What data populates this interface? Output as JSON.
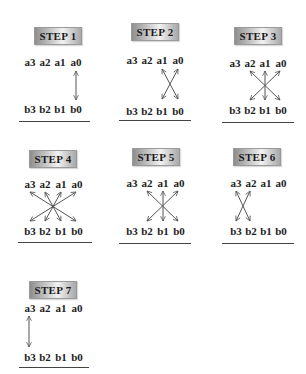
{
  "diagram": {
    "a_labels": [
      "a3",
      "a2",
      "a1",
      "a0"
    ],
    "b_labels": [
      "b3",
      "b2",
      "b1",
      "b0"
    ],
    "steps": [
      {
        "label": "STEP 1",
        "connections": [
          [
            "a0",
            "b0"
          ]
        ]
      },
      {
        "label": "STEP 2",
        "connections": [
          [
            "a1",
            "b0"
          ],
          [
            "a0",
            "b1"
          ]
        ]
      },
      {
        "label": "STEP 3",
        "connections": [
          [
            "a2",
            "b0"
          ],
          [
            "a1",
            "b1"
          ],
          [
            "a0",
            "b2"
          ]
        ]
      },
      {
        "label": "STEP 4",
        "connections": [
          [
            "a3",
            "b0"
          ],
          [
            "a2",
            "b1"
          ],
          [
            "a1",
            "b2"
          ],
          [
            "a0",
            "b3"
          ]
        ]
      },
      {
        "label": "STEP 5",
        "connections": [
          [
            "a3",
            "b1"
          ],
          [
            "a2",
            "b2"
          ],
          [
            "a1",
            "b3"
          ]
        ]
      },
      {
        "label": "STEP 6",
        "connections": [
          [
            "a3",
            "b2"
          ],
          [
            "a2",
            "b3"
          ]
        ]
      },
      {
        "label": "STEP 7",
        "connections": [
          [
            "a3",
            "b3"
          ]
        ]
      }
    ]
  },
  "s1": {
    "title": "STEP 1",
    "a3": "a3",
    "a2": "a2",
    "a1": "a1",
    "a0": "a0",
    "b3": "b3",
    "b2": "b2",
    "b1": "b1",
    "b0": "b0"
  },
  "s2": {
    "title": "STEP 2",
    "a3": "a3",
    "a2": "a2",
    "a1": "a1",
    "a0": "a0",
    "b3": "b3",
    "b2": "b2",
    "b1": "b1",
    "b0": "b0"
  },
  "s3": {
    "title": "STEP 3",
    "a3": "a3",
    "a2": "a2",
    "a1": "a1",
    "a0": "a0",
    "b3": "b3",
    "b2": "b2",
    "b1": "b1",
    "b0": "b0"
  },
  "s4": {
    "title": "STEP 4",
    "a3": "a3",
    "a2": "a2",
    "a1": "a1",
    "a0": "a0",
    "b3": "b3",
    "b2": "b2",
    "b1": "b1",
    "b0": "b0"
  },
  "s5": {
    "title": "STEP 5",
    "a3": "a3",
    "a2": "a2",
    "a1": "a1",
    "a0": "a0",
    "b3": "b3",
    "b2": "b2",
    "b1": "b1",
    "b0": "b0"
  },
  "s6": {
    "title": "STEP 6",
    "a3": "a3",
    "a2": "a2",
    "a1": "a1",
    "a0": "a0",
    "b3": "b3",
    "b2": "b2",
    "b1": "b1",
    "b0": "b0"
  },
  "s7": {
    "title": "STEP 7",
    "a3": "a3",
    "a2": "a2",
    "a1": "a1",
    "a0": "a0",
    "b3": "b3",
    "b2": "b2",
    "b1": "b1",
    "b0": "b0"
  }
}
